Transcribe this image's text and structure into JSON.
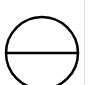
{
  "symbol": {
    "name": "circle-with-horizontal-bar",
    "stroke_color": "#000000",
    "fill_color": "#ffffff",
    "center_x": 42,
    "center_y": 53,
    "radius": 36,
    "stroke_width": 2.5
  },
  "edge": {
    "color": "#d9d9d9"
  },
  "background": "#ffffff"
}
